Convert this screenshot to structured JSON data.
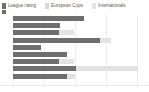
{
  "legend": {
    "position": "top-left",
    "items": [
      {
        "label": "League rating",
        "color": "#6e6e6e",
        "icon": "legend-swatch-icon"
      },
      {
        "label": "European Cups",
        "color": "#b8b8b8",
        "icon": "legend-swatch-icon"
      },
      {
        "label": "Internationals",
        "color": "#e2e2e2",
        "icon": "legend-swatch-icon"
      }
    ]
  },
  "colors": {
    "league_rating": "#6e6e6e",
    "european_cups": "#b8b8b8",
    "internationals": "#e2e2e2",
    "gridline": "#ececec",
    "background": "#ffffff",
    "text": "#5b5b5b"
  },
  "chart_data": {
    "type": "bar",
    "orientation": "horizontal",
    "stacked": true,
    "title": "",
    "subtitle": "",
    "xlabel": "",
    "ylabel": "",
    "grid": true,
    "legend_position": "top-left",
    "categories": [
      "1",
      "2",
      "3",
      "4",
      "5",
      "6",
      "7",
      "8",
      "9"
    ],
    "tick_labels": [],
    "xlim": [
      0,
      140
    ],
    "series": [
      {
        "name": "League rating",
        "color": "#6e6e6e",
        "values": [
          75,
          50,
          49,
          92,
          30,
          57,
          49,
          67,
          57
        ]
      },
      {
        "name": "European Cups",
        "color": "#b8b8b8",
        "values": [
          0,
          0,
          0,
          0,
          0,
          0,
          0,
          0,
          0
        ]
      },
      {
        "name": "Internationals",
        "color": "#e2e2e2",
        "values": [
          0,
          0,
          16,
          12,
          0,
          0,
          16,
          66,
          9
        ]
      }
    ]
  }
}
